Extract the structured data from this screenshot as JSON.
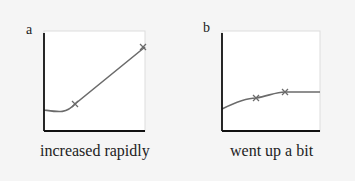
{
  "panels": [
    {
      "letter": "a",
      "caption": "increased rapidly"
    },
    {
      "letter": "b",
      "caption": "went up a bit"
    }
  ],
  "colors": {
    "background": "#f5f5f5",
    "plot": "#ffffff",
    "curve": "#6b6b6b",
    "axis": "#111111"
  }
}
